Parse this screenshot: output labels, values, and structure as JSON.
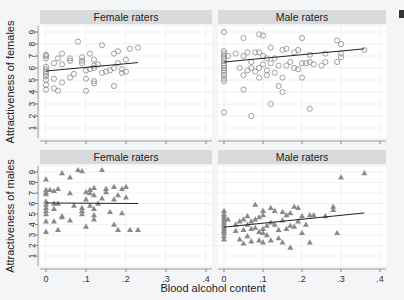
{
  "chart_data": {
    "type": "scatter",
    "layout": "2x2 facet grid",
    "xlabel": "Blood alcohol content",
    "x_ticks": [
      "0",
      ".1",
      ".2",
      ".3",
      ".4"
    ],
    "xlim": [
      0,
      0.4
    ],
    "y_ticks": [
      "1",
      "2",
      "3",
      "4",
      "5",
      "6",
      "7",
      "8",
      "9"
    ],
    "ylim": [
      1,
      9
    ],
    "grid": true,
    "panels": [
      {
        "title": "Female raters",
        "ylabel": "Attractiveness of females",
        "marker": "circle",
        "fit_line": {
          "x": [
            0,
            0.23
          ],
          "y": [
            5.75,
            6.45
          ]
        },
        "points": [
          [
            0,
            4.2
          ],
          [
            0,
            4.6
          ],
          [
            0,
            5.0
          ],
          [
            0,
            5.3
          ],
          [
            0,
            5.5
          ],
          [
            0,
            5.7
          ],
          [
            0,
            5.9
          ],
          [
            0,
            6.1
          ],
          [
            0,
            6.8
          ],
          [
            0,
            7.0
          ],
          [
            0,
            7.1
          ],
          [
            0.02,
            5.1
          ],
          [
            0.02,
            4.3
          ],
          [
            0.02,
            6.4
          ],
          [
            0.03,
            6.8
          ],
          [
            0.03,
            4.1
          ],
          [
            0.04,
            7.2
          ],
          [
            0.04,
            6.3
          ],
          [
            0.04,
            4.8
          ],
          [
            0.06,
            6.8
          ],
          [
            0.06,
            6.6
          ],
          [
            0.06,
            5.2
          ],
          [
            0.07,
            5.5
          ],
          [
            0.08,
            8.2
          ],
          [
            0.09,
            6.9
          ],
          [
            0.09,
            6.6
          ],
          [
            0.09,
            6.4
          ],
          [
            0.1,
            5.1
          ],
          [
            0.1,
            4.1
          ],
          [
            0.1,
            5.8
          ],
          [
            0.11,
            7.2
          ],
          [
            0.11,
            5.9
          ],
          [
            0.12,
            6.0
          ],
          [
            0.12,
            6.7
          ],
          [
            0.12,
            6.2
          ],
          [
            0.12,
            4.9
          ],
          [
            0.12,
            4.7
          ],
          [
            0.13,
            6.3
          ],
          [
            0.14,
            7.9
          ],
          [
            0.14,
            5.6
          ],
          [
            0.15,
            5.7
          ],
          [
            0.16,
            5.8
          ],
          [
            0.17,
            7.2
          ],
          [
            0.17,
            6.0
          ],
          [
            0.17,
            4.5
          ],
          [
            0.18,
            7.4
          ],
          [
            0.18,
            6.4
          ],
          [
            0.19,
            5.9
          ],
          [
            0.19,
            5.6
          ],
          [
            0.2,
            6.7
          ],
          [
            0.2,
            5.7
          ],
          [
            0.21,
            7.6
          ],
          [
            0.23,
            7.7
          ]
        ]
      },
      {
        "title": "Male raters",
        "ylabel": "Attractiveness of females",
        "marker": "circle",
        "fit_line": {
          "x": [
            0,
            0.36
          ],
          "y": [
            6.5,
            7.6
          ]
        },
        "points": [
          [
            0,
            4.9
          ],
          [
            0,
            5.1
          ],
          [
            0,
            5.4
          ],
          [
            0,
            5.6
          ],
          [
            0,
            5.8
          ],
          [
            0,
            6.0
          ],
          [
            0,
            6.2
          ],
          [
            0,
            6.4
          ],
          [
            0,
            6.6
          ],
          [
            0,
            6.8
          ],
          [
            0,
            7.0
          ],
          [
            0,
            7.2
          ],
          [
            0,
            7.4
          ],
          [
            0,
            9.0
          ],
          [
            0,
            2.3
          ],
          [
            0.01,
            7.0
          ],
          [
            0.03,
            7.2
          ],
          [
            0.04,
            6.0
          ],
          [
            0.05,
            5.4
          ],
          [
            0.05,
            7.0
          ],
          [
            0.05,
            4.2
          ],
          [
            0.05,
            8.5
          ],
          [
            0.06,
            5.8
          ],
          [
            0.06,
            7.3
          ],
          [
            0.07,
            6.5
          ],
          [
            0.07,
            6.0
          ],
          [
            0.07,
            2.0
          ],
          [
            0.08,
            7.3
          ],
          [
            0.08,
            5.7
          ],
          [
            0.09,
            6.0
          ],
          [
            0.09,
            7.3
          ],
          [
            0.09,
            8.8
          ],
          [
            0.09,
            5.2
          ],
          [
            0.1,
            6.3
          ],
          [
            0.1,
            7.0
          ],
          [
            0.1,
            8.7
          ],
          [
            0.11,
            6.8
          ],
          [
            0.11,
            5.8
          ],
          [
            0.11,
            5.4
          ],
          [
            0.12,
            6.4
          ],
          [
            0.12,
            7.7
          ],
          [
            0.12,
            3.0
          ],
          [
            0.13,
            6.8
          ],
          [
            0.13,
            5.6
          ],
          [
            0.14,
            4.5
          ],
          [
            0.14,
            6.2
          ],
          [
            0.15,
            5.2
          ],
          [
            0.15,
            4.0
          ],
          [
            0.15,
            7.5
          ],
          [
            0.16,
            7.6
          ],
          [
            0.16,
            6.2
          ],
          [
            0.17,
            6.5
          ],
          [
            0.18,
            7.3
          ],
          [
            0.18,
            6.0
          ],
          [
            0.19,
            5.9
          ],
          [
            0.19,
            7.5
          ],
          [
            0.2,
            8.5
          ],
          [
            0.2,
            6.4
          ],
          [
            0.2,
            5.2
          ],
          [
            0.21,
            6.4
          ],
          [
            0.22,
            7.1
          ],
          [
            0.22,
            6.5
          ],
          [
            0.22,
            2.6
          ],
          [
            0.23,
            6.3
          ],
          [
            0.25,
            6.2
          ],
          [
            0.26,
            6.5
          ],
          [
            0.26,
            7.2
          ],
          [
            0.29,
            6.5
          ],
          [
            0.29,
            8.3
          ],
          [
            0.3,
            6.9
          ],
          [
            0.3,
            7.2
          ],
          [
            0.3,
            8.0
          ],
          [
            0.36,
            7.5
          ]
        ]
      },
      {
        "title": "Female raters",
        "ylabel": "Attractiveness of males",
        "marker": "triangle",
        "fit_line": {
          "x": [
            0,
            0.23
          ],
          "y": [
            6.05,
            6.0
          ]
        },
        "points": [
          [
            0,
            3.3
          ],
          [
            0,
            4.3
          ],
          [
            0,
            5.0
          ],
          [
            0,
            5.3
          ],
          [
            0,
            5.6
          ],
          [
            0,
            5.9
          ],
          [
            0,
            6.2
          ],
          [
            0,
            6.9
          ],
          [
            0,
            7.1
          ],
          [
            0,
            7.3
          ],
          [
            0,
            8.3
          ],
          [
            0.01,
            7.3
          ],
          [
            0.02,
            5.5
          ],
          [
            0.02,
            6.0
          ],
          [
            0.02,
            7.2
          ],
          [
            0.02,
            4.3
          ],
          [
            0.03,
            3.5
          ],
          [
            0.03,
            6.0
          ],
          [
            0.03,
            7.4
          ],
          [
            0.04,
            8.9
          ],
          [
            0.04,
            4.7
          ],
          [
            0.04,
            4.8
          ],
          [
            0.06,
            4.4
          ],
          [
            0.06,
            7.0
          ],
          [
            0.06,
            8.5
          ],
          [
            0.07,
            5.8
          ],
          [
            0.08,
            9.2
          ],
          [
            0.09,
            9.1
          ],
          [
            0.09,
            5.0
          ],
          [
            0.09,
            5.3
          ],
          [
            0.09,
            5.6
          ],
          [
            0.1,
            7.1
          ],
          [
            0.1,
            6.4
          ],
          [
            0.1,
            3.8
          ],
          [
            0.11,
            7.3
          ],
          [
            0.11,
            7.0
          ],
          [
            0.11,
            5.8
          ],
          [
            0.12,
            7.5
          ],
          [
            0.12,
            5.5
          ],
          [
            0.12,
            4.9
          ],
          [
            0.12,
            4.5
          ],
          [
            0.12,
            6.8
          ],
          [
            0.13,
            6.0
          ],
          [
            0.14,
            9.2
          ],
          [
            0.14,
            6.5
          ],
          [
            0.15,
            7.4
          ],
          [
            0.15,
            7.1
          ],
          [
            0.16,
            5.2
          ],
          [
            0.17,
            7.6
          ],
          [
            0.17,
            6.4
          ],
          [
            0.17,
            4.0
          ],
          [
            0.18,
            6.8
          ],
          [
            0.18,
            3.5
          ],
          [
            0.19,
            7.4
          ],
          [
            0.19,
            5.1
          ],
          [
            0.2,
            7.6
          ],
          [
            0.2,
            6.6
          ],
          [
            0.21,
            3.5
          ],
          [
            0.23,
            3.5
          ]
        ]
      },
      {
        "title": "Male raters",
        "ylabel": "Attractiveness of males",
        "marker": "triangle",
        "fit_line": {
          "x": [
            0,
            0.36
          ],
          "y": [
            3.75,
            5.1
          ]
        },
        "points": [
          [
            0,
            2.6
          ],
          [
            0,
            2.9
          ],
          [
            0,
            3.2
          ],
          [
            0,
            3.4
          ],
          [
            0,
            3.6
          ],
          [
            0,
            3.8
          ],
          [
            0,
            4.0
          ],
          [
            0,
            4.2
          ],
          [
            0,
            4.4
          ],
          [
            0,
            4.6
          ],
          [
            0,
            4.8
          ],
          [
            0,
            5.0
          ],
          [
            0,
            5.3
          ],
          [
            0.01,
            4.5
          ],
          [
            0.03,
            4.0
          ],
          [
            0.03,
            3.4
          ],
          [
            0.04,
            4.3
          ],
          [
            0.04,
            2.6
          ],
          [
            0.05,
            4.5
          ],
          [
            0.05,
            3.5
          ],
          [
            0.05,
            2.2
          ],
          [
            0.06,
            4.8
          ],
          [
            0.06,
            4.0
          ],
          [
            0.06,
            2.9
          ],
          [
            0.07,
            4.3
          ],
          [
            0.07,
            3.6
          ],
          [
            0.07,
            2.4
          ],
          [
            0.08,
            5.9
          ],
          [
            0.08,
            4.5
          ],
          [
            0.08,
            3.7
          ],
          [
            0.09,
            4.7
          ],
          [
            0.09,
            3.3
          ],
          [
            0.09,
            2.5
          ],
          [
            0.1,
            4.9
          ],
          [
            0.1,
            3.6
          ],
          [
            0.1,
            3.2
          ],
          [
            0.1,
            2.3
          ],
          [
            0.1,
            5.3
          ],
          [
            0.11,
            3.9
          ],
          [
            0.11,
            3.0
          ],
          [
            0.12,
            5.6
          ],
          [
            0.12,
            4.2
          ],
          [
            0.12,
            2.5
          ],
          [
            0.13,
            5.3
          ],
          [
            0.13,
            4.0
          ],
          [
            0.14,
            3.5
          ],
          [
            0.14,
            2.7
          ],
          [
            0.15,
            4.4
          ],
          [
            0.15,
            5.2
          ],
          [
            0.15,
            2.3
          ],
          [
            0.16,
            4.9
          ],
          [
            0.16,
            3.6
          ],
          [
            0.17,
            5.1
          ],
          [
            0.17,
            3.9
          ],
          [
            0.17,
            1.8
          ],
          [
            0.18,
            5.7
          ],
          [
            0.18,
            3.8
          ],
          [
            0.19,
            4.3
          ],
          [
            0.19,
            5.6
          ],
          [
            0.2,
            4.8
          ],
          [
            0.2,
            3.2
          ],
          [
            0.21,
            4.0
          ],
          [
            0.22,
            4.9
          ],
          [
            0.22,
            2.3
          ],
          [
            0.23,
            4.9
          ],
          [
            0.26,
            4.8
          ],
          [
            0.28,
            5.7
          ],
          [
            0.28,
            5.4
          ],
          [
            0.29,
            3.2
          ],
          [
            0.3,
            8.5
          ],
          [
            0.36,
            8.9
          ]
        ]
      }
    ]
  },
  "labels": {
    "xlabel": "Blood alcohol content",
    "row_labels": [
      "Attractiveness of females",
      "Attractiveness of males"
    ],
    "col_titles": [
      "Female raters",
      "Male raters"
    ]
  },
  "colors": {
    "background": "#f4f5f6",
    "plot_bg": "#ffffff",
    "strip_bg": "#d9dadb",
    "marker": "#8a8a8a",
    "fit_line": "#222222",
    "grid": "#eaeef2"
  }
}
